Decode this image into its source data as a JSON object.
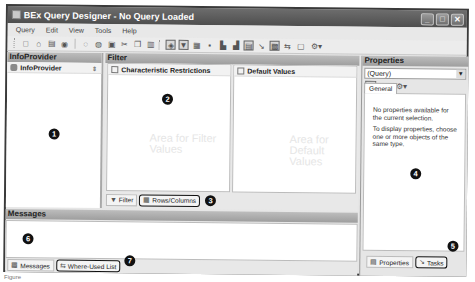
{
  "window": {
    "title": "BEx Query Designer - No Query Loaded",
    "controls": {
      "minimize": "_",
      "maximize": "□",
      "close": "✕"
    }
  },
  "menubar": {
    "items": [
      {
        "label": "Query"
      },
      {
        "label": "Edit"
      },
      {
        "label": "View"
      },
      {
        "label": "Tools"
      },
      {
        "label": "Help"
      }
    ]
  },
  "toolbar": {
    "buttons": [
      {
        "icon": "new-icon",
        "glyph": "□"
      },
      {
        "icon": "open-icon",
        "glyph": "⌂"
      },
      {
        "icon": "save-icon",
        "glyph": "▤"
      },
      {
        "icon": "save-all-icon",
        "glyph": "◉"
      },
      {
        "icon": "undo-icon",
        "glyph": "◌"
      },
      {
        "icon": "redo-icon",
        "glyph": "◍"
      },
      {
        "icon": "check-icon",
        "glyph": "▣"
      },
      {
        "icon": "cut-icon",
        "glyph": "✂"
      },
      {
        "icon": "copy-icon",
        "glyph": "❐"
      },
      {
        "icon": "paste-icon",
        "glyph": "▥"
      },
      {
        "icon": "infoprovider-icon",
        "glyph": "◈",
        "active": true
      },
      {
        "icon": "filter-icon",
        "glyph": "▼",
        "active": true
      },
      {
        "icon": "rows-columns-icon",
        "glyph": "▦"
      },
      {
        "icon": "cells-icon",
        "glyph": "▪"
      },
      {
        "icon": "conditions-icon",
        "glyph": "▙"
      },
      {
        "icon": "exceptions-icon",
        "glyph": "▟"
      },
      {
        "icon": "properties-icon",
        "glyph": "▤",
        "active": true
      },
      {
        "icon": "tasks-icon",
        "glyph": "↘"
      },
      {
        "icon": "messages-icon",
        "glyph": "▩",
        "active": true
      },
      {
        "icon": "where-used-icon",
        "glyph": "⇆"
      },
      {
        "icon": "document-icon",
        "glyph": "▢"
      },
      {
        "icon": "technical-names-icon",
        "glyph": "⚙▾"
      }
    ]
  },
  "infoprovider": {
    "header": "InfoProvider",
    "row_label": "InfoProvider",
    "badge": "1"
  },
  "filter": {
    "header": "Filter",
    "characteristic_restrictions": {
      "title": "Characteristic Restrictions",
      "watermark": "Area for Filter Values",
      "badge": "2"
    },
    "default_values": {
      "title": "Default Values",
      "watermark": "Area for Default Values"
    },
    "tabs": [
      {
        "label": "Filter",
        "icon": "filter-icon",
        "glyph": "▼"
      },
      {
        "label": "Rows/Columns",
        "icon": "rows-columns-icon",
        "glyph": "▦",
        "highlighted": true
      }
    ],
    "tabs_badge": "3"
  },
  "properties": {
    "header": "Properties",
    "selected": "(Query)",
    "toolbar": [
      {
        "icon": "edit-icon",
        "glyph": "✎"
      },
      {
        "icon": "save-icon",
        "glyph": "▤"
      },
      {
        "icon": "technical-names-icon",
        "glyph": "⚙▾"
      }
    ],
    "tab": "General",
    "message_1": "No properties available for the current selection.",
    "message_2": "To display properties, choose one or more objects of the same type.",
    "badge": "4",
    "bottom_tabs": [
      {
        "label": "Properties",
        "icon": "properties-icon",
        "glyph": "▤"
      },
      {
        "label": "Tasks",
        "icon": "tasks-icon",
        "glyph": "↘",
        "highlighted": true
      }
    ],
    "tabs_badge": "5"
  },
  "messages": {
    "header": "Messages",
    "badge": "6",
    "tabs": [
      {
        "label": "Messages",
        "icon": "messages-icon",
        "glyph": "▩"
      },
      {
        "label": "Where-Used List",
        "icon": "where-used-icon",
        "glyph": "⇆",
        "highlighted": true
      }
    ],
    "tabs_badge": "7"
  },
  "caption": "Figure"
}
